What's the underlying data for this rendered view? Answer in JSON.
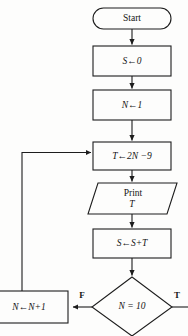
{
  "diagram": {
    "background_color": "#fdfdfc",
    "line_color": "#1d1d1d",
    "text_color": "#151515",
    "nodes": {
      "start": {
        "shape": "terminator",
        "label": "Start"
      },
      "init_sum": {
        "shape": "process",
        "label": "S←0"
      },
      "init_n": {
        "shape": "process",
        "label": "N←1"
      },
      "compute_t": {
        "shape": "process",
        "label": "T←2N −9"
      },
      "print_t": {
        "shape": "input-output",
        "label_line1": "Print",
        "label_line2": "T"
      },
      "accumulate": {
        "shape": "process",
        "label": "S←S+T"
      },
      "decision": {
        "shape": "decision",
        "label": "N = 10"
      },
      "increment_n": {
        "shape": "process",
        "label": "N←N+1"
      }
    },
    "branch_labels": {
      "false": "F",
      "true": "T"
    }
  }
}
